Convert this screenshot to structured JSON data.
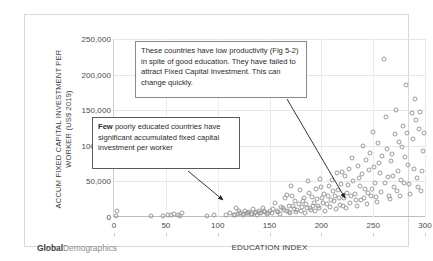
{
  "brand": {
    "bold_part": "Global",
    "light_part": "Demographics"
  },
  "annotations": {
    "top_note": "These countries have  low productivity (Fig 5-2) in spite of good education. They have failed to attract Fixed Capital Investment.   This can change quickly.",
    "bottom_note_lead": "Few",
    "bottom_note_rest": " poorly educated countries have significant accumulated fixed capital investment per worker"
  },
  "chart_data": {
    "type": "scatter",
    "title": "",
    "xlabel": "EDUCATION INDEX",
    "ylabel": "ACCUM FIXED CAPITAL INVESTMENT PER WORKER (US$ 2019)",
    "xlim": [
      0,
      300
    ],
    "ylim": [
      0,
      250000
    ],
    "xticks": [
      0,
      50,
      100,
      150,
      200,
      250,
      300
    ],
    "xticklabels": [
      "0",
      "50",
      "100",
      "150",
      "200",
      "250",
      "300"
    ],
    "yticks": [
      0,
      50000,
      100000,
      150000,
      200000,
      250000
    ],
    "yticklabels": [
      "0",
      "50,000",
      "100,000",
      "150,000",
      "200,000",
      "250,000"
    ],
    "grid": "horizontal-and-vertical-light",
    "legend": "none",
    "marker": "open-circle",
    "marker_color": "#9a9a9a",
    "points": [
      [
        2,
        2000
      ],
      [
        3,
        9000
      ],
      [
        36,
        1500
      ],
      [
        47,
        2000
      ],
      [
        52,
        3000
      ],
      [
        55,
        2500
      ],
      [
        58,
        4000
      ],
      [
        62,
        3000
      ],
      [
        64,
        2000
      ],
      [
        66,
        5000
      ],
      [
        90,
        1500
      ],
      [
        96,
        2500
      ],
      [
        108,
        3000
      ],
      [
        112,
        5000
      ],
      [
        116,
        2500
      ],
      [
        118,
        12000
      ],
      [
        120,
        4000
      ],
      [
        122,
        6000
      ],
      [
        124,
        3000
      ],
      [
        126,
        9000
      ],
      [
        128,
        5000
      ],
      [
        130,
        7000
      ],
      [
        132,
        4000
      ],
      [
        134,
        11000
      ],
      [
        136,
        6000
      ],
      [
        138,
        3500
      ],
      [
        140,
        8000
      ],
      [
        142,
        5000
      ],
      [
        144,
        13000
      ],
      [
        146,
        6500
      ],
      [
        148,
        4000
      ],
      [
        150,
        9000
      ],
      [
        152,
        5500
      ],
      [
        155,
        20000
      ],
      [
        158,
        7000
      ],
      [
        160,
        4500
      ],
      [
        163,
        12000
      ],
      [
        165,
        26000
      ],
      [
        167,
        8000
      ],
      [
        169,
        15000
      ],
      [
        170,
        5000
      ],
      [
        172,
        30000
      ],
      [
        174,
        11000
      ],
      [
        176,
        7000
      ],
      [
        178,
        18000
      ],
      [
        180,
        9000
      ],
      [
        182,
        22000
      ],
      [
        184,
        6000
      ],
      [
        186,
        13000
      ],
      [
        188,
        34000
      ],
      [
        190,
        10000
      ],
      [
        192,
        16000
      ],
      [
        194,
        8000
      ],
      [
        196,
        25000
      ],
      [
        198,
        12000
      ],
      [
        200,
        42000
      ],
      [
        202,
        19000
      ],
      [
        204,
        9000
      ],
      [
        206,
        30000
      ],
      [
        208,
        14000
      ],
      [
        210,
        52000
      ],
      [
        212,
        22000
      ],
      [
        214,
        11000
      ],
      [
        216,
        38000
      ],
      [
        218,
        17000
      ],
      [
        220,
        63000
      ],
      [
        222,
        27000
      ],
      [
        224,
        13000
      ],
      [
        226,
        45000
      ],
      [
        228,
        20000
      ],
      [
        230,
        83000
      ],
      [
        232,
        33000
      ],
      [
        234,
        15000
      ],
      [
        236,
        55000
      ],
      [
        238,
        24000
      ],
      [
        240,
        100000
      ],
      [
        242,
        40000
      ],
      [
        244,
        18000
      ],
      [
        246,
        66000
      ],
      [
        248,
        29000
      ],
      [
        250,
        120000
      ],
      [
        252,
        48000
      ],
      [
        254,
        21000
      ],
      [
        256,
        76000
      ],
      [
        258,
        35000
      ],
      [
        260,
        222000
      ],
      [
        262,
        140000
      ],
      [
        264,
        56000
      ],
      [
        266,
        25000
      ],
      [
        268,
        88000
      ],
      [
        270,
        42000
      ],
      [
        272,
        150000
      ],
      [
        274,
        64000
      ],
      [
        276,
        29000
      ],
      [
        278,
        98000
      ],
      [
        280,
        48000
      ],
      [
        282,
        186000
      ],
      [
        284,
        73000
      ],
      [
        286,
        33000
      ],
      [
        288,
        110000
      ],
      [
        290,
        166000
      ],
      [
        292,
        55000
      ],
      [
        294,
        124000
      ],
      [
        296,
        37000
      ],
      [
        298,
        92000
      ],
      [
        291,
        136000
      ],
      [
        287,
        146000
      ],
      [
        283,
        118000
      ],
      [
        279,
        128000
      ],
      [
        275,
        106000
      ],
      [
        271,
        116000
      ],
      [
        267,
        78000
      ],
      [
        263,
        96000
      ],
      [
        259,
        86000
      ],
      [
        255,
        104000
      ],
      [
        251,
        70000
      ],
      [
        247,
        90000
      ],
      [
        243,
        80000
      ],
      [
        239,
        60000
      ],
      [
        235,
        72000
      ],
      [
        231,
        50000
      ],
      [
        227,
        68000
      ],
      [
        223,
        58000
      ],
      [
        219,
        46000
      ],
      [
        215,
        62000
      ],
      [
        211,
        36000
      ],
      [
        207,
        44000
      ],
      [
        203,
        32000
      ],
      [
        199,
        54000
      ],
      [
        195,
        40000
      ],
      [
        191,
        28000
      ],
      [
        187,
        50000
      ],
      [
        183,
        26000
      ],
      [
        179,
        38000
      ],
      [
        175,
        23000
      ],
      [
        171,
        44000
      ],
      [
        167,
        31000
      ],
      [
        295,
        148000
      ],
      [
        299,
        118000
      ],
      [
        297,
        64000
      ],
      [
        293,
        42000
      ],
      [
        289,
        68000
      ],
      [
        285,
        46000
      ],
      [
        281,
        84000
      ],
      [
        277,
        52000
      ],
      [
        273,
        36000
      ],
      [
        269,
        58000
      ],
      [
        265,
        30000
      ],
      [
        261,
        48000
      ],
      [
        257,
        62000
      ],
      [
        253,
        28000
      ],
      [
        249,
        40000
      ],
      [
        245,
        34000
      ],
      [
        241,
        26000
      ],
      [
        237,
        44000
      ],
      [
        233,
        24000
      ],
      [
        229,
        30000
      ],
      [
        225,
        34000
      ],
      [
        221,
        16000
      ],
      [
        217,
        26000
      ],
      [
        213,
        30000
      ],
      [
        209,
        24000
      ],
      [
        205,
        18000
      ],
      [
        201,
        26000
      ],
      [
        197,
        15000
      ],
      [
        193,
        20000
      ],
      [
        189,
        12000
      ],
      [
        185,
        18000
      ],
      [
        181,
        14000
      ],
      [
        177,
        10000
      ],
      [
        173,
        16000
      ],
      [
        169,
        7000
      ],
      [
        164,
        10000
      ],
      [
        161,
        14000
      ],
      [
        157,
        8000
      ],
      [
        153,
        11000
      ],
      [
        149,
        6000
      ],
      [
        145,
        9000
      ],
      [
        141,
        5000
      ],
      [
        137,
        7000
      ],
      [
        133,
        4500
      ],
      [
        129,
        6000
      ],
      [
        125,
        4000
      ],
      [
        121,
        8000
      ],
      [
        117,
        3500
      ]
    ]
  }
}
